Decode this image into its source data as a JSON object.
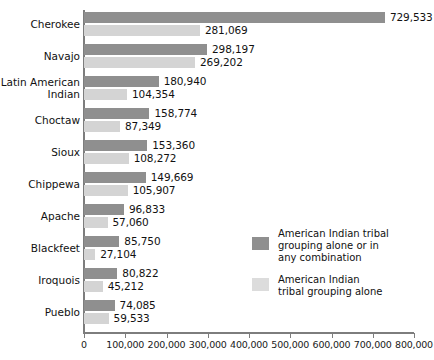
{
  "chart_data": {
    "type": "bar",
    "orientation": "horizontal",
    "title": "",
    "xlabel": "",
    "ylabel": "",
    "xlim": [
      0,
      800000
    ],
    "xticks": [
      0,
      100000,
      200000,
      300000,
      400000,
      500000,
      600000,
      700000,
      800000
    ],
    "xtick_labels": [
      "0",
      "100,000",
      "200,000",
      "300,000",
      "400,000",
      "500,000",
      "600,000",
      "700,000",
      "800,000"
    ],
    "grid": false,
    "legend_position": "center-right",
    "categories": [
      "Cherokee",
      "Navajo",
      "Latin American\nIndian",
      "Choctaw",
      "Sioux",
      "Chippewa",
      "Apache",
      "Blackfeet",
      "Iroquois",
      "Pueblo"
    ],
    "series": [
      {
        "name": "American Indian tribal grouping alone or in any combination",
        "color": "#8f8f8f",
        "values": [
          729533,
          298197,
          180940,
          158774,
          153360,
          149669,
          96833,
          85750,
          80822,
          74085
        ],
        "labels": [
          "729,533",
          "298,197",
          "180,940",
          "158,774",
          "153,360",
          "149,669",
          "96,833",
          "85,750",
          "80,822",
          "74,085"
        ]
      },
      {
        "name": "American Indian tribal grouping alone",
        "color": "#d4d4d4",
        "values": [
          281069,
          269202,
          104354,
          87349,
          108272,
          105907,
          57060,
          27104,
          45212,
          59533
        ],
        "labels": [
          "281,069",
          "269,202",
          "104,354",
          "87,349",
          "108,272",
          "105,907",
          "57,060",
          "27,104",
          "45,212",
          "59,533"
        ]
      }
    ]
  },
  "legend": {
    "items": [
      {
        "label": "American Indian tribal\ngrouping alone or in\nany combination",
        "color": "#8f8f8f"
      },
      {
        "label": "American Indian\ntribal grouping alone",
        "color": "#dcdcdc"
      }
    ]
  }
}
